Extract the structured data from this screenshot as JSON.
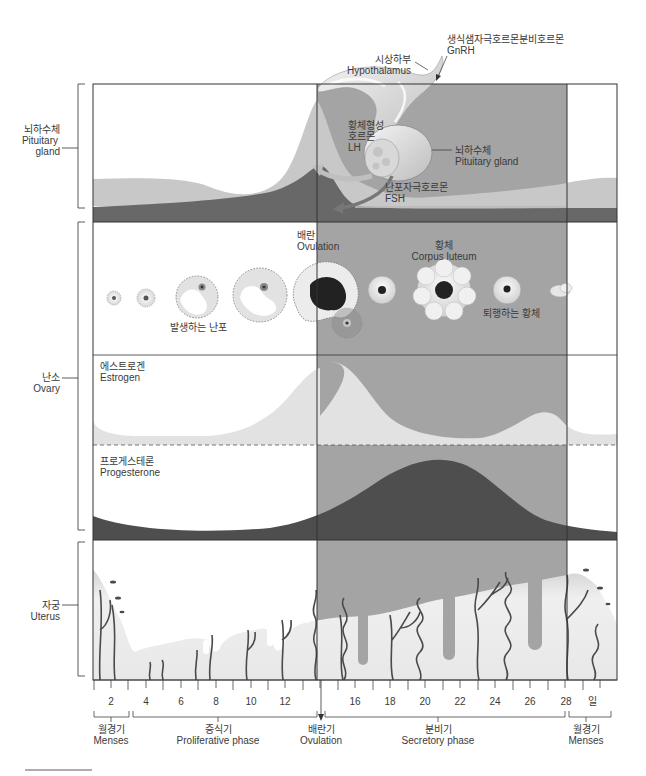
{
  "colors": {
    "secretory_band": "#a4a4a4",
    "lh_fill": "#c8c8c8",
    "fsh_fill": "#6a6a6a",
    "estrogen_fill": "#e2e2e2",
    "progesterone_fill": "#4e4e4e",
    "endometrium_fill": "#ececec",
    "vessel": "#4a4a4a",
    "frame": "#333333"
  },
  "side_labels": {
    "pituitary": {
      "ko": "뇌하수체",
      "en_1": "Pituitary",
      "en_2": "gland"
    },
    "ovary": {
      "ko": "난소",
      "en": "Ovary"
    },
    "uterus": {
      "ko": "자궁",
      "en": "Uterus"
    }
  },
  "pituitary_panel": {
    "gnrh": {
      "ko": "생식샘자극호르몬분비호르몬",
      "en": "GnRH"
    },
    "hypothalamus": {
      "ko": "시상하부",
      "en": "Hypothalamus"
    },
    "lh": {
      "ko_1": "황체형성",
      "ko_2": "호르몬",
      "en": "LH"
    },
    "pituitary_gland": {
      "ko": "뇌하수체",
      "en": "Pituitary gland"
    },
    "fsh": {
      "ko": "난포자극호르몬",
      "en": "FSH"
    }
  },
  "ovary_panel": {
    "developing_follicles": "발생하는 난포",
    "ovulation": {
      "ko": "배란",
      "en": "Ovulation"
    },
    "corpus_luteum": {
      "ko": "황체",
      "en": "Corpus luteum"
    },
    "degenerating_corpus_luteum": "퇴행하는 황체",
    "estrogen": {
      "ko": "에스트로겐",
      "en": "Estrogen"
    },
    "progesterone": {
      "ko": "프로게스테론",
      "en": "Progesterone"
    }
  },
  "axis": {
    "day_labels": [
      {
        "day": 2,
        "label": "2"
      },
      {
        "day": 4,
        "label": "4"
      },
      {
        "day": 6,
        "label": "6"
      },
      {
        "day": 8,
        "label": "8"
      },
      {
        "day": 10,
        "label": "10"
      },
      {
        "day": 12,
        "label": "12"
      },
      {
        "day": 16,
        "label": "16"
      },
      {
        "day": 18,
        "label": "18"
      },
      {
        "day": 20,
        "label": "20"
      },
      {
        "day": 22,
        "label": "22"
      },
      {
        "day": 24,
        "label": "24"
      },
      {
        "day": 26,
        "label": "26"
      },
      {
        "day": 28,
        "label": "28"
      }
    ],
    "unit_label": "일"
  },
  "phases": [
    {
      "ko": "월경기",
      "en": "Menses"
    },
    {
      "ko": "증식기",
      "en": "Proliferative phase"
    },
    {
      "ko": "배란기",
      "en": "Ovulation"
    },
    {
      "ko": "분비기",
      "en": "Secretory phase"
    },
    {
      "ko": "월경기",
      "en": "Menses"
    }
  ]
}
